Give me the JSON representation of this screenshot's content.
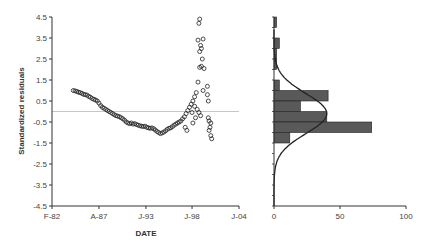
{
  "chart_data": [
    {
      "type": "scatter",
      "title": "",
      "xlabel": "DATE",
      "ylabel": "Standardized residuals",
      "ylim": [
        -4.5,
        4.5
      ],
      "yticks": [
        4.5,
        3.5,
        2.5,
        1.5,
        0.5,
        -0.5,
        -1.5,
        -2.5,
        -3.5,
        -4.5
      ],
      "xtick_labels": [
        "F-82",
        "A-87",
        "J-93",
        "J-98",
        "J-04"
      ],
      "xtick_years": [
        1982.1,
        1987.6,
        1993.1,
        1998.5,
        2004.0
      ],
      "xlim": [
        1982.1,
        2004.0
      ],
      "reference_line": {
        "y": 0,
        "color": "#b0b0b0"
      },
      "grid": false,
      "marker": "open-circle",
      "series": [
        {
          "name": "Standardized residuals",
          "points": [
            [
              1984.6,
              1.0
            ],
            [
              1984.8,
              0.98
            ],
            [
              1985.0,
              0.95
            ],
            [
              1985.2,
              0.92
            ],
            [
              1985.4,
              0.9
            ],
            [
              1985.6,
              0.86
            ],
            [
              1985.8,
              0.82
            ],
            [
              1986.0,
              0.8
            ],
            [
              1986.2,
              0.78
            ],
            [
              1986.4,
              0.72
            ],
            [
              1986.6,
              0.68
            ],
            [
              1986.8,
              0.62
            ],
            [
              1987.0,
              0.58
            ],
            [
              1987.2,
              0.55
            ],
            [
              1987.4,
              0.5
            ],
            [
              1987.6,
              0.4
            ],
            [
              1987.8,
              0.28
            ],
            [
              1988.0,
              0.2
            ],
            [
              1988.2,
              0.15
            ],
            [
              1988.4,
              0.1
            ],
            [
              1988.6,
              0.05
            ],
            [
              1988.8,
              0.0
            ],
            [
              1989.0,
              -0.05
            ],
            [
              1989.2,
              -0.1
            ],
            [
              1989.4,
              -0.15
            ],
            [
              1989.6,
              -0.2
            ],
            [
              1989.8,
              -0.22
            ],
            [
              1990.0,
              -0.25
            ],
            [
              1990.2,
              -0.3
            ],
            [
              1990.4,
              -0.35
            ],
            [
              1990.6,
              -0.42
            ],
            [
              1990.8,
              -0.5
            ],
            [
              1991.0,
              -0.55
            ],
            [
              1991.2,
              -0.58
            ],
            [
              1991.4,
              -0.55
            ],
            [
              1991.6,
              -0.6
            ],
            [
              1991.8,
              -0.58
            ],
            [
              1992.0,
              -0.62
            ],
            [
              1992.2,
              -0.65
            ],
            [
              1992.4,
              -0.68
            ],
            [
              1992.6,
              -0.7
            ],
            [
              1992.8,
              -0.72
            ],
            [
              1993.0,
              -0.7
            ],
            [
              1993.2,
              -0.75
            ],
            [
              1993.4,
              -0.78
            ],
            [
              1993.6,
              -0.8
            ],
            [
              1993.8,
              -0.78
            ],
            [
              1994.0,
              -0.82
            ],
            [
              1994.2,
              -0.88
            ],
            [
              1994.4,
              -0.95
            ],
            [
              1994.6,
              -1.0
            ],
            [
              1994.8,
              -1.05
            ],
            [
              1995.0,
              -1.02
            ],
            [
              1995.2,
              -0.98
            ],
            [
              1995.4,
              -0.92
            ],
            [
              1995.6,
              -0.85
            ],
            [
              1995.8,
              -0.8
            ],
            [
              1996.0,
              -0.78
            ],
            [
              1996.2,
              -0.72
            ],
            [
              1996.4,
              -0.65
            ],
            [
              1996.6,
              -0.6
            ],
            [
              1996.8,
              -0.55
            ],
            [
              1997.0,
              -0.5
            ],
            [
              1997.2,
              -0.45
            ],
            [
              1997.4,
              -0.35
            ],
            [
              1997.6,
              -0.25
            ],
            [
              1997.8,
              -0.1
            ],
            [
              1998.0,
              0.05
            ],
            [
              1998.2,
              0.2
            ],
            [
              1998.4,
              0.35
            ],
            [
              1998.6,
              0.5
            ],
            [
              1998.8,
              0.7
            ],
            [
              1999.0,
              0.9
            ],
            [
              1998.9,
              -0.3
            ],
            [
              1998.6,
              -0.55
            ],
            [
              1997.9,
              -0.9
            ],
            [
              1997.7,
              -0.75
            ],
            [
              1999.2,
              1.4
            ],
            [
              1999.4,
              2.1
            ],
            [
              1999.6,
              2.15
            ],
            [
              1999.9,
              2.05
            ],
            [
              1999.7,
              2.5
            ],
            [
              1999.4,
              2.85
            ],
            [
              1999.6,
              3.0
            ],
            [
              1999.5,
              3.15
            ],
            [
              1999.2,
              3.4
            ],
            [
              1999.8,
              3.45
            ],
            [
              1999.3,
              4.2
            ],
            [
              1999.4,
              4.4
            ],
            [
              1999.8,
              1.0
            ],
            [
              2000.3,
              1.2
            ],
            [
              2000.3,
              0.8
            ],
            [
              2000.4,
              0.5
            ],
            [
              2000.4,
              -0.3
            ],
            [
              2000.5,
              -0.45
            ],
            [
              2000.7,
              -0.55
            ],
            [
              2000.6,
              -0.75
            ],
            [
              2000.5,
              -0.9
            ],
            [
              2000.7,
              -1.15
            ],
            [
              2000.8,
              -1.3
            ],
            [
              1999.5,
              -0.2
            ],
            [
              1999.3,
              -0.05
            ],
            [
              1999.1,
              0.1
            ],
            [
              1998.8,
              0.25
            ],
            [
              1998.5,
              -0.05
            ]
          ]
        }
      ]
    },
    {
      "type": "bar",
      "orientation": "horizontal",
      "title": "",
      "xlabel": "",
      "ylabel": "",
      "xlim": [
        0,
        100
      ],
      "xticks": [
        0,
        50,
        100
      ],
      "ylim": [
        -4.5,
        4.5
      ],
      "bin_width": 0.5,
      "bars": [
        {
          "bin": [
            4.0,
            4.5
          ],
          "count": 2
        },
        {
          "bin": [
            3.0,
            3.5
          ],
          "count": 4
        },
        {
          "bin": [
            2.5,
            3.0
          ],
          "count": 2
        },
        {
          "bin": [
            2.0,
            2.5
          ],
          "count": 2
        },
        {
          "bin": [
            1.0,
            1.5
          ],
          "count": 4
        },
        {
          "bin": [
            0.5,
            1.0
          ],
          "count": 41
        },
        {
          "bin": [
            0.0,
            0.5
          ],
          "count": 20
        },
        {
          "bin": [
            -0.5,
            0.0
          ],
          "count": 40
        },
        {
          "bin": [
            -1.0,
            -0.5
          ],
          "count": 74
        },
        {
          "bin": [
            -1.5,
            -1.0
          ],
          "count": 12
        }
      ],
      "bar_color": "#595959",
      "overlay": {
        "type": "normal-curve",
        "mean": -0.1,
        "sd": 0.95,
        "peak": 40
      }
    }
  ]
}
